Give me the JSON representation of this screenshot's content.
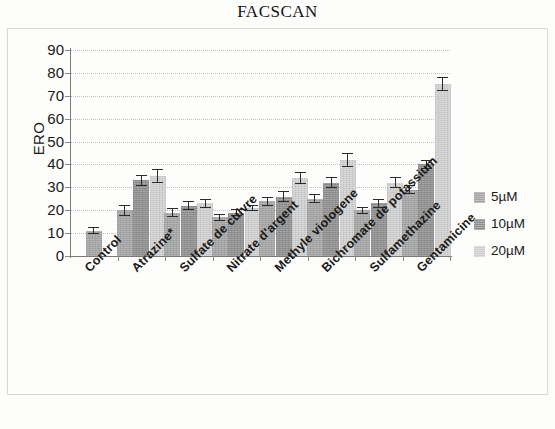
{
  "chart_data": {
    "type": "bar",
    "title": "FACSCAN",
    "xlabel": "",
    "ylabel": "ERO",
    "ylim": [
      0,
      90
    ],
    "ytick_step": 10,
    "yticks": [
      90,
      80,
      70,
      60,
      50,
      40,
      30,
      20,
      10,
      0
    ],
    "grid": true,
    "legend_position": "right",
    "categories": [
      "Control",
      "Atrazine*",
      "Sulfate de cuivre",
      "Nitrate d'argent",
      "Methyle viologene",
      "Bichromate de potassium",
      "Sulfamethazine",
      "Gentamicine"
    ],
    "series": [
      {
        "name": "5µM",
        "color": "#a3a3a3",
        "values": [
          11,
          20,
          19,
          17,
          24,
          25,
          20,
          29
        ],
        "errors": [
          1.5,
          2.5,
          2.0,
          1.5,
          2.0,
          2.0,
          1.5,
          2.0
        ]
      },
      {
        "name": "10µM",
        "color": "#8e8e8e",
        "values": [
          null,
          33,
          22,
          19,
          26,
          32,
          23,
          40
        ],
        "errors": [
          null,
          2.5,
          2.0,
          1.5,
          2.5,
          2.5,
          2.0,
          2.0
        ]
      },
      {
        "name": "20µM",
        "color": "#cfcfcf",
        "values": [
          null,
          35,
          23,
          21,
          34,
          42,
          32,
          75
        ],
        "errors": [
          null,
          3.0,
          2.0,
          1.5,
          2.5,
          3.0,
          2.5,
          3.0
        ]
      }
    ]
  },
  "legend": {
    "items": [
      {
        "label": "5µM",
        "swatch": "legend-swatch-5um"
      },
      {
        "label": "10µM",
        "swatch": "legend-swatch-10um"
      },
      {
        "label": "20µM",
        "swatch": "legend-swatch-20um"
      }
    ]
  }
}
